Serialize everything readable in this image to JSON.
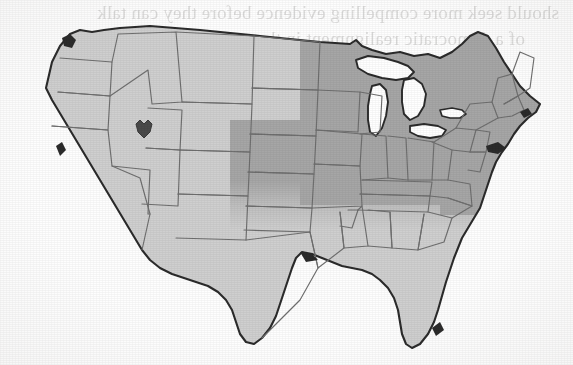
{
  "page": {
    "kind": "scanned-book-page",
    "background_color": "#fefefe"
  },
  "bleed_through": {
    "description": "faint mirrored text showing through from the reverse side of the printed page",
    "mirrored": true,
    "lines": [
      "should seek more compelling evidence before they can talk",
      "of a democratic realignment in the countryside"
    ]
  },
  "map": {
    "title": "United States regional shading map",
    "projection_note": "contiguous 48 states, state outlines shown",
    "colors": {
      "light_fill": "#cfcfcf",
      "dark_fill": "#a6a6a6",
      "state_border": "#6f6f6f",
      "coast_outline": "#2b2b2b",
      "lake_fill": "#ffffff",
      "marker": "#4a4a4a"
    },
    "legend_present": false,
    "shaded_region": {
      "label": "dark shaded band",
      "fill": "#a6a6a6",
      "edge_style": "soft gradient, not aligned to state lines",
      "states": [
        "Montana (east)",
        "North Dakota",
        "South Dakota",
        "Nebraska",
        "Kansas",
        "Minnesota",
        "Iowa",
        "Missouri",
        "Wisconsin",
        "Illinois",
        "Indiana",
        "Ohio",
        "Michigan",
        "Kentucky",
        "West Virginia",
        "Virginia",
        "Pennsylvania",
        "New York",
        "New Jersey",
        "Delaware",
        "Maryland",
        "Connecticut",
        "Rhode Island",
        "Massachusetts",
        "Vermont",
        "New Hampshire",
        "Maine"
      ]
    },
    "unshaded_region": {
      "label": "light region",
      "fill": "#cfcfcf",
      "states": [
        "Washington",
        "Oregon",
        "California",
        "Nevada",
        "Idaho",
        "Utah",
        "Arizona",
        "Wyoming",
        "Colorado",
        "New Mexico",
        "Texas",
        "Oklahoma",
        "Arkansas",
        "Louisiana",
        "Mississippi",
        "Alabama",
        "Tennessee",
        "Georgia",
        "Florida",
        "South Carolina",
        "North Carolina",
        "Montana (west)"
      ]
    },
    "great_lakes": {
      "rendered_as": "white cutouts",
      "names": [
        "Lake Superior",
        "Lake Michigan",
        "Lake Huron",
        "Lake Erie",
        "Lake Ontario"
      ]
    },
    "marker": {
      "name": "point-marker",
      "location_state": "Utah",
      "shape": "small dark blob",
      "color": "#4a4a4a"
    }
  }
}
